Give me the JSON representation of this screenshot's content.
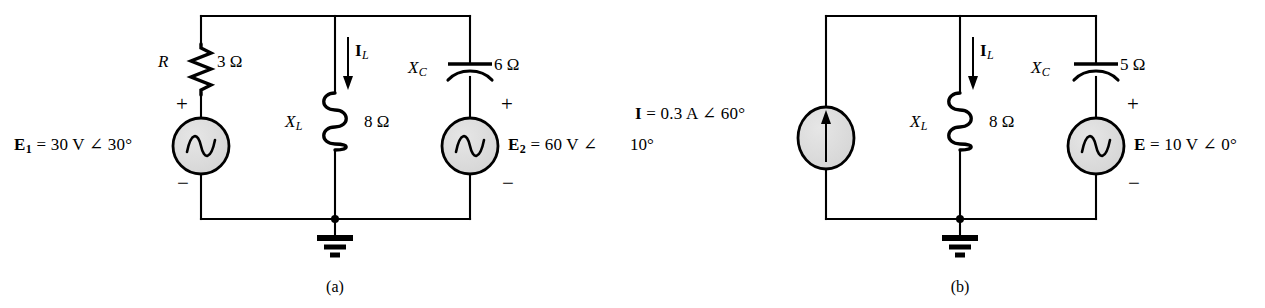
{
  "figure": {
    "background_color": "#ffffff",
    "line_color": "#000000",
    "source_fill_color": "#d9d9d9"
  },
  "circuit_a": {
    "caption": "(a)",
    "source_left": {
      "type": "ac-voltage-source",
      "label": "E",
      "subscript": "1",
      "equals": "=",
      "value": "30 V ∠ 30°",
      "full_text": "E₁ = 30 V ∠ 30°",
      "plus": "+",
      "minus": "−"
    },
    "resistor": {
      "type": "resistor",
      "label": "R",
      "value": "3 Ω"
    },
    "inductor": {
      "type": "inductor",
      "label": "X",
      "subscript": "L",
      "value": "8 Ω"
    },
    "capacitor": {
      "type": "capacitor",
      "label": "X",
      "subscript": "C",
      "value": "6 Ω"
    },
    "branch_current": {
      "label": "I",
      "subscript": "L",
      "direction": "down"
    },
    "source_right": {
      "type": "ac-voltage-source",
      "label": "E",
      "subscript": "2",
      "equals": "=",
      "value": "60 V ∠ 10°",
      "value_line1": "60 V ∠",
      "value_line2": "10°",
      "full_text": "E₂ = 60 V ∠ 10°",
      "plus": "+",
      "minus": "−"
    },
    "ground": {
      "label": "ground"
    }
  },
  "circuit_b": {
    "caption": "(b)",
    "source_left": {
      "type": "ac-current-source",
      "label": "I",
      "equals": "=",
      "value": "0.3 A ∠ 60°",
      "full_text": "I = 0.3 A ∠ 60°",
      "arrow_direction": "up"
    },
    "inductor": {
      "type": "inductor",
      "label": "X",
      "subscript": "L",
      "value": "8 Ω"
    },
    "capacitor": {
      "type": "capacitor",
      "label": "X",
      "subscript": "C",
      "value": "5 Ω"
    },
    "branch_current": {
      "label": "I",
      "subscript": "L",
      "direction": "down"
    },
    "source_right": {
      "type": "ac-voltage-source",
      "label": "E",
      "equals": "=",
      "value": "10 V ∠ 0°",
      "full_text": "E = 10 V ∠ 0°",
      "plus": "+",
      "minus": "−"
    },
    "ground": {
      "label": "ground"
    }
  }
}
